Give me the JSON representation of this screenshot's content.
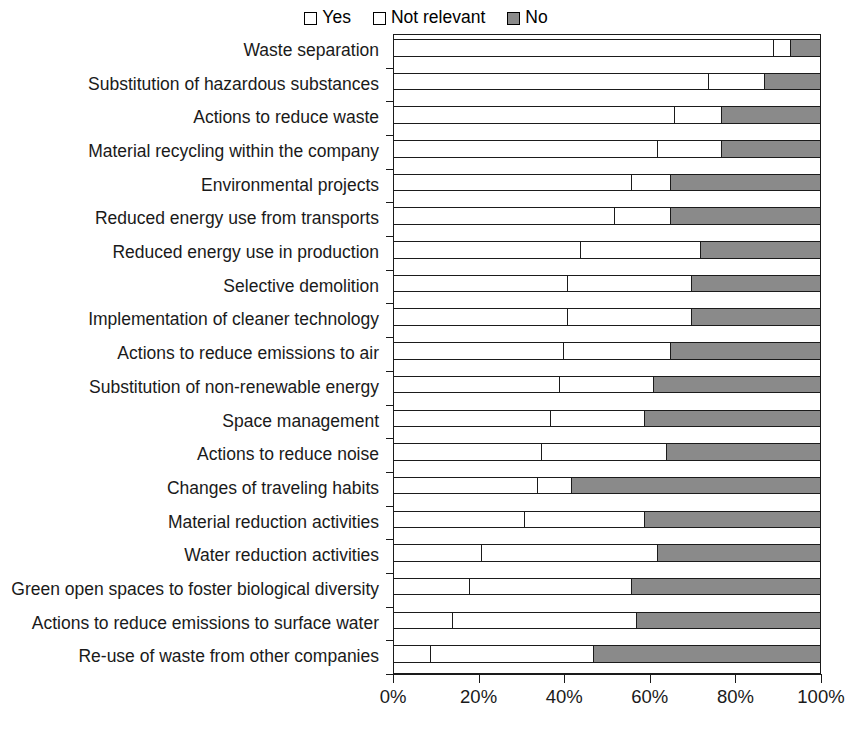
{
  "chart_data": {
    "type": "bar",
    "orientation": "horizontal",
    "stacked": true,
    "normalized_percent": true,
    "title": "",
    "subtitle": "",
    "xlabel": "",
    "ylabel": "",
    "xlim": [
      0,
      100
    ],
    "xticks": [
      0,
      20,
      40,
      60,
      80,
      100
    ],
    "xtick_labels": [
      "0%",
      "20%",
      "40%",
      "60%",
      "80%",
      "100%"
    ],
    "grid": false,
    "legend_position": "top-center",
    "legend": [
      "Yes",
      "Not relevant",
      "No"
    ],
    "series_colors": [
      "#ffffff",
      "#ffffff",
      "#8a8a8a"
    ],
    "categories": [
      "Waste separation",
      "Substitution of hazardous substances",
      "Actions to reduce waste",
      "Material recycling within the company",
      "Environmental projects",
      "Reduced energy use from transports",
      "Reduced energy use in production",
      "Selective demolition",
      "Implementation of cleaner technology",
      "Actions to reduce emissions to air",
      "Substitution of non-renewable energy",
      "Space management",
      "Actions to reduce noise",
      "Changes of traveling habits",
      "Material reduction activities",
      "Water reduction activities",
      "Green open spaces to foster biological diversity",
      "Actions to reduce emissions to surface water",
      "Re-use of waste from other companies"
    ],
    "series": [
      {
        "name": "Yes",
        "values": [
          89,
          74,
          66,
          62,
          56,
          52,
          44,
          41,
          41,
          40,
          39,
          37,
          35,
          34,
          31,
          21,
          18,
          14,
          9
        ]
      },
      {
        "name": "Not relevant",
        "values": [
          4,
          13,
          11,
          15,
          9,
          13,
          28,
          29,
          29,
          25,
          21,
          22,
          29,
          8,
          28,
          41,
          38,
          43,
          38
        ]
      },
      {
        "name": "No",
        "values": [
          7,
          13,
          23,
          23,
          35,
          35,
          28,
          30,
          30,
          35,
          40,
          41,
          36,
          58,
          41,
          38,
          44,
          43,
          53
        ]
      }
    ],
    "cumulative_boundaries_percent": [
      [
        89,
        93
      ],
      [
        74,
        87
      ],
      [
        66,
        77
      ],
      [
        62,
        77
      ],
      [
        56,
        65
      ],
      [
        52,
        65
      ],
      [
        44,
        72
      ],
      [
        41,
        70
      ],
      [
        41,
        70
      ],
      [
        40,
        65
      ],
      [
        39,
        61
      ],
      [
        37,
        59
      ],
      [
        35,
        64
      ],
      [
        34,
        42
      ],
      [
        31,
        59
      ],
      [
        21,
        62
      ],
      [
        18,
        56
      ],
      [
        14,
        57
      ],
      [
        9,
        47
      ]
    ]
  },
  "legend": {
    "items": [
      {
        "label": "Yes",
        "swatch": "legend-swatch-white",
        "color": "#ffffff"
      },
      {
        "label": "Not relevant",
        "swatch": "legend-swatch-white",
        "color": "#ffffff"
      },
      {
        "label": "No",
        "swatch": "legend-swatch-gray",
        "color": "#8a8a8a"
      }
    ]
  },
  "axis": {
    "x_tick_labels": [
      "0%",
      "20%",
      "40%",
      "60%",
      "80%",
      "100%"
    ]
  },
  "colors": {
    "yes": "#ffffff",
    "not_relevant": "#ffffff",
    "no": "#8a8a8a",
    "outline": "#1b1b1b",
    "background": "#ffffff"
  }
}
